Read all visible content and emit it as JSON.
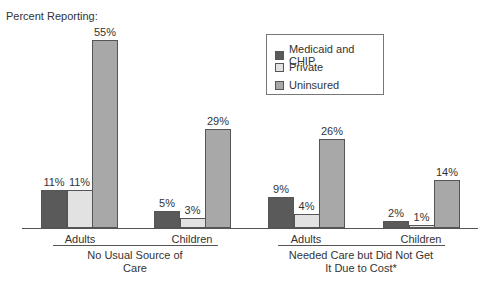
{
  "chart_data": {
    "type": "bar",
    "title": "",
    "ylabel": "Percent Reporting:",
    "xlabel": "",
    "groups": [
      {
        "label": "No Usual Source of Care",
        "label_lines": [
          "No Usual Source of",
          "Care"
        ],
        "categories": [
          "Adults",
          "Children"
        ]
      },
      {
        "label": "Needed Care but Did Not Get It Due to Cost*",
        "label_lines": [
          "Needed Care but Did Not Get",
          "It Due to Cost*"
        ],
        "categories": [
          "Adults",
          "Children"
        ]
      }
    ],
    "categories": [
      "No Usual Source of Care - Adults",
      "No Usual Source of Care - Children",
      "Needed Care but Did Not Get It Due to Cost* - Adults",
      "Needed Care but Did Not Get It Due to Cost* - Children"
    ],
    "series": [
      {
        "name": "Medicaid and CHIP",
        "color": "#5a5a5a",
        "values": [
          11,
          5,
          9,
          2
        ]
      },
      {
        "name": "Private",
        "color": "#e2e2e2",
        "values": [
          11,
          3,
          4,
          1
        ]
      },
      {
        "name": "Uninsured",
        "color": "#a8a8a8",
        "values": [
          55,
          29,
          26,
          14
        ]
      }
    ],
    "value_labels": {
      "Medicaid and CHIP": [
        "11%",
        "5%",
        "9%",
        "2%"
      ],
      "Private": [
        "11%",
        "3%",
        "4%",
        "1%"
      ],
      "Uninsured": [
        "55%",
        "29%",
        "26%",
        "14%"
      ]
    },
    "ylim": [
      0,
      60
    ],
    "grid": false,
    "legend_position": "upper right (inside)"
  },
  "legend": {
    "items": [
      {
        "label": "Medicaid and CHIP",
        "color": "#5a5a5a"
      },
      {
        "label": "Private",
        "color": "#e2e2e2"
      },
      {
        "label": "Uninsured",
        "color": "#a8a8a8"
      }
    ]
  },
  "axis": {
    "ylabel": "Percent Reporting:"
  },
  "groups": [
    {
      "line1": "No Usual Source of",
      "line2": "Care",
      "cats": [
        "Adults",
        "Children"
      ]
    },
    {
      "line1": "Needed Care but Did Not Get",
      "line2": "It Due to Cost*",
      "cats": [
        "Adults",
        "Children"
      ]
    }
  ]
}
